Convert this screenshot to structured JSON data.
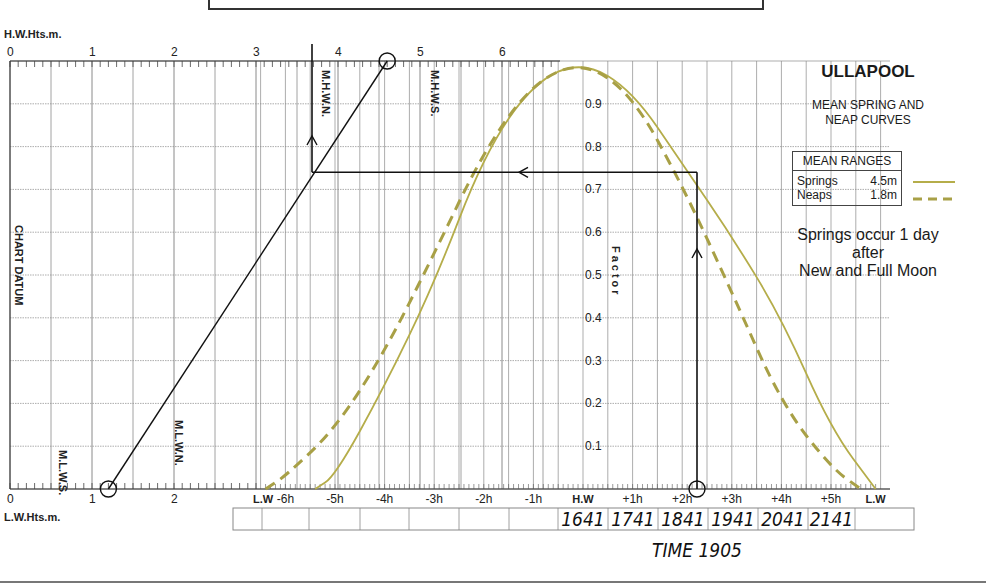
{
  "chart_data": {
    "type": "line",
    "title": "ULLAPOOL",
    "subtitle": "MEAN SPRING AND NEAP CURVES",
    "top_axis": {
      "label": "H.W.Hts.m.",
      "ticks": [
        "0",
        "1",
        "2",
        "3",
        "4",
        "5",
        "6"
      ]
    },
    "bottom_axis": {
      "label": "L.W.Hts.m.",
      "ticks": [
        "0",
        "1",
        "2"
      ]
    },
    "factor_axis": {
      "label": "Factor",
      "ticks": [
        "0.1",
        "0.2",
        "0.3",
        "0.4",
        "0.5",
        "0.6",
        "0.7",
        "0.8",
        "0.9"
      ],
      "range": [
        0,
        1
      ]
    },
    "time_axis": {
      "ticks": [
        "L.W",
        "-6h",
        "-5h",
        "-4h",
        "-3h",
        "-2h",
        "-1h",
        "H.W",
        "+1h",
        "+2h",
        "+3h",
        "+4h",
        "+5h",
        "L.W"
      ]
    },
    "vertical_labels": {
      "mhwn": "M.H.W.N.",
      "mhws": "M.H.W.S.",
      "mlws": "M.L.W.S.",
      "mlwn": "M.L.W.N.",
      "chart_datum": "CHART DATUM"
    },
    "series": [
      {
        "name": "Springs",
        "style": "solid",
        "color": "#b5ad4a",
        "x_hours": [
          -5.4,
          -5,
          -4,
          -3,
          -2,
          -1,
          0,
          1,
          2,
          3,
          4,
          5,
          5.9
        ],
        "factor": [
          0.0,
          0.03,
          0.24,
          0.48,
          0.78,
          0.95,
          1.0,
          0.93,
          0.76,
          0.59,
          0.4,
          0.14,
          0.0
        ]
      },
      {
        "name": "Neaps",
        "style": "dashed",
        "color": "#a8a046",
        "x_hours": [
          -6.4,
          -6,
          -5,
          -4,
          -3,
          -2,
          -1,
          0,
          1,
          2,
          3,
          4,
          5,
          5.6
        ],
        "factor": [
          0.0,
          0.03,
          0.14,
          0.32,
          0.55,
          0.79,
          0.95,
          1.0,
          0.92,
          0.71,
          0.46,
          0.2,
          0.05,
          0.0
        ]
      }
    ],
    "worked_example": {
      "hw_height_m": 4.6,
      "lw_height_m": 1.2,
      "factor": 0.74,
      "time_offset": "+2h 24m",
      "result_height_mhwn_line": 3.7
    }
  },
  "legend": {
    "header": "MEAN RANGES",
    "rows": [
      {
        "name": "Springs",
        "value": "4.5m"
      },
      {
        "name": "Neaps",
        "value": "1.8m"
      }
    ]
  },
  "side_note": [
    "Springs occur 1 day",
    "after",
    "New and Full Moon"
  ],
  "time_table": {
    "cells": [
      "",
      "",
      "",
      "",
      "",
      "",
      "",
      "1641",
      "1741",
      "1841",
      "1941",
      "2041",
      "2141",
      ""
    ],
    "caption": "TIME 1905"
  }
}
